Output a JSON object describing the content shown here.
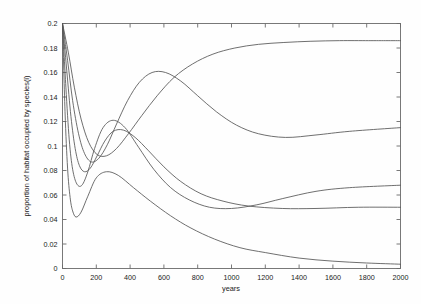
{
  "chart_data": {
    "type": "line",
    "title": "",
    "xlabel": "years",
    "ylabel": "proportion of habitat occupied by species(i)",
    "xlim": [
      0,
      2000
    ],
    "ylim": [
      0,
      0.2
    ],
    "grid": false,
    "legend": "none",
    "xticks": [
      0,
      200,
      400,
      600,
      800,
      1000,
      1200,
      1400,
      1600,
      1800,
      2000
    ],
    "xticklabels": [
      "0",
      "200",
      "400",
      "600",
      "800",
      "1000",
      "1200",
      "1400",
      "1600",
      "1800",
      "2000"
    ],
    "yticks": [
      0,
      0.02,
      0.04,
      0.06,
      0.08,
      0.1,
      0.12,
      0.14,
      0.16,
      0.18,
      0.2
    ],
    "yticklabels": [
      "0",
      "0.02",
      "0.04",
      "0.06",
      "0.08",
      "0.1",
      "0.12",
      "0.14",
      "0.16",
      "0.18",
      "0.2"
    ],
    "line_color": "#555555",
    "initial_value": 0.2,
    "series": [
      {
        "name": "species 1",
        "x": [
          0,
          15,
          30,
          45,
          60,
          80,
          110,
          150,
          200,
          260,
          330,
          420,
          520,
          640,
          760,
          900,
          1050,
          1200,
          1400,
          1600,
          1800,
          2000
        ],
        "y": [
          0.2,
          0.128,
          0.082,
          0.058,
          0.047,
          0.042,
          0.046,
          0.059,
          0.074,
          0.079,
          0.076,
          0.066,
          0.055,
          0.043,
          0.033,
          0.024,
          0.017,
          0.013,
          0.0085,
          0.006,
          0.0045,
          0.0035
        ]
      },
      {
        "name": "species 2",
        "x": [
          0,
          20,
          40,
          60,
          85,
          115,
          150,
          190,
          240,
          300,
          370,
          450,
          540,
          640,
          750,
          870,
          1000,
          1150,
          1300,
          1500,
          1700,
          2000
        ],
        "y": [
          0.2,
          0.148,
          0.105,
          0.081,
          0.069,
          0.068,
          0.079,
          0.098,
          0.115,
          0.121,
          0.115,
          0.099,
          0.081,
          0.066,
          0.056,
          0.05,
          0.049,
          0.052,
          0.057,
          0.063,
          0.066,
          0.068
        ]
      },
      {
        "name": "species 3",
        "x": [
          0,
          25,
          50,
          75,
          100,
          130,
          165,
          205,
          250,
          300,
          360,
          430,
          510,
          600,
          700,
          820,
          950,
          1100,
          1300,
          1500,
          1750,
          2000
        ],
        "y": [
          0.2,
          0.162,
          0.124,
          0.098,
          0.084,
          0.079,
          0.082,
          0.092,
          0.104,
          0.112,
          0.113,
          0.107,
          0.096,
          0.083,
          0.071,
          0.061,
          0.055,
          0.051,
          0.049,
          0.049,
          0.05,
          0.05
        ]
      },
      {
        "name": "species 4",
        "x": [
          0,
          30,
          60,
          95,
          130,
          170,
          215,
          265,
          320,
          385,
          455,
          530,
          610,
          700,
          800,
          910,
          1030,
          1160,
          1320,
          1500,
          1700,
          2000
        ],
        "y": [
          0.2,
          0.17,
          0.137,
          0.11,
          0.094,
          0.087,
          0.09,
          0.101,
          0.118,
          0.137,
          0.152,
          0.16,
          0.16,
          0.153,
          0.141,
          0.128,
          0.117,
          0.11,
          0.107,
          0.109,
          0.112,
          0.115
        ]
      },
      {
        "name": "species 5",
        "x": [
          0,
          35,
          70,
          110,
          155,
          205,
          260,
          320,
          390,
          470,
          560,
          660,
          770,
          890,
          1020,
          1160,
          1310,
          1470,
          1640,
          1810,
          1900,
          2000
        ],
        "y": [
          0.2,
          0.176,
          0.148,
          0.122,
          0.103,
          0.093,
          0.092,
          0.098,
          0.11,
          0.125,
          0.141,
          0.156,
          0.167,
          0.175,
          0.18,
          0.183,
          0.1845,
          0.1855,
          0.186,
          0.186,
          0.186,
          0.186
        ]
      }
    ]
  }
}
